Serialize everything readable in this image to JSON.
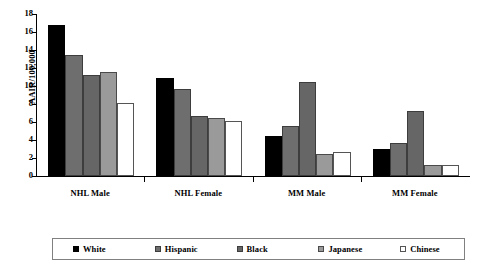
{
  "chart_data": {
    "type": "bar",
    "title": "",
    "xlabel": "",
    "ylabel": "AAIR/100,000",
    "ylim": [
      0,
      18
    ],
    "ytick_step": 2,
    "yticks": [
      0,
      2,
      4,
      6,
      8,
      10,
      12,
      14,
      16,
      18
    ],
    "ytick_labels": [
      "0",
      "2",
      "4",
      "6",
      "8",
      "10",
      "12",
      "14",
      "16",
      "18"
    ],
    "grid": false,
    "legend_position": "bottom",
    "categories": [
      "NHL Male",
      "NHL Female",
      "MM Male",
      "MM Female"
    ],
    "series": [
      {
        "name": "White",
        "color": "#000000",
        "values": [
          16.8,
          10.9,
          4.5,
          3.0
        ]
      },
      {
        "name": "Hispanic",
        "color": "#6e6e6e",
        "values": [
          13.5,
          9.7,
          5.6,
          3.7
        ]
      },
      {
        "name": "Black",
        "color": "#666666",
        "values": [
          11.2,
          6.7,
          10.4,
          7.2
        ]
      },
      {
        "name": "Japanese",
        "color": "#9a9a9a",
        "values": [
          11.6,
          6.4,
          2.5,
          1.2
        ]
      },
      {
        "name": "Chinese",
        "color": "#ffffff",
        "values": [
          8.1,
          6.1,
          2.7,
          1.2
        ]
      }
    ]
  },
  "legend": {
    "entries": [
      {
        "label": "White"
      },
      {
        "label": "Hispanic"
      },
      {
        "label": "Black"
      },
      {
        "label": "Japanese"
      },
      {
        "label": "Chinese"
      }
    ]
  }
}
